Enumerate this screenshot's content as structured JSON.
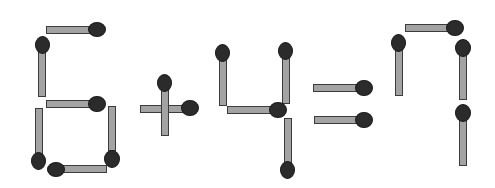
{
  "puzzle": {
    "equation": "6+4=7",
    "colors": {
      "stick": "#a3a3a3",
      "stick_outline": "#3c3c3c",
      "head": "#2b2b2b"
    },
    "matches": [
      {
        "group": "digit-6",
        "name": "six-top",
        "stick": [
          46,
          26,
          45,
          8
        ],
        "head": [
          88,
          22,
          18,
          15
        ]
      },
      {
        "group": "digit-6",
        "name": "six-upper-left",
        "stick": [
          38,
          50,
          8,
          47
        ],
        "head": [
          35,
          36,
          15,
          18
        ]
      },
      {
        "group": "digit-6",
        "name": "six-middle",
        "stick": [
          46,
          100,
          45,
          8
        ],
        "head": [
          88,
          96,
          18,
          16
        ]
      },
      {
        "group": "digit-6",
        "name": "six-lower-left",
        "stick": [
          35,
          108,
          8,
          47
        ],
        "head": [
          31,
          152,
          15,
          18
        ]
      },
      {
        "group": "digit-6",
        "name": "six-lower-right",
        "stick": [
          108,
          106,
          8,
          45
        ],
        "head": [
          104,
          150,
          16,
          18
        ]
      },
      {
        "group": "digit-6",
        "name": "six-bottom",
        "stick": [
          62,
          165,
          45,
          8
        ],
        "head": [
          47,
          162,
          18,
          15
        ]
      },
      {
        "group": "plus",
        "name": "plus-horizontal",
        "stick": [
          140,
          105,
          44,
          8
        ],
        "head": [
          181,
          100,
          18,
          16
        ]
      },
      {
        "group": "plus",
        "name": "plus-vertical",
        "stick": [
          161,
          89,
          8,
          47
        ],
        "head": [
          157,
          74,
          15,
          18
        ]
      },
      {
        "group": "digit-4",
        "name": "four-left",
        "stick": [
          219,
          59,
          8,
          47
        ],
        "head": [
          215,
          44,
          15,
          18
        ]
      },
      {
        "group": "digit-4",
        "name": "four-right",
        "stick": [
          282,
          57,
          8,
          47
        ],
        "head": [
          278,
          42,
          15,
          18
        ]
      },
      {
        "group": "digit-4",
        "name": "four-horizontal",
        "stick": [
          227,
          106,
          44,
          8
        ],
        "head": [
          269,
          102,
          18,
          16
        ]
      },
      {
        "group": "digit-4",
        "name": "four-lower",
        "stick": [
          284,
          118,
          8,
          46
        ],
        "head": [
          280,
          161,
          15,
          18
        ]
      },
      {
        "group": "equals",
        "name": "equals-top",
        "stick": [
          313,
          84,
          44,
          8
        ],
        "head": [
          355,
          80,
          18,
          16
        ]
      },
      {
        "group": "equals",
        "name": "equals-bottom",
        "stick": [
          314,
          116,
          44,
          8
        ],
        "head": [
          355,
          112,
          18,
          16
        ]
      },
      {
        "group": "digit-7",
        "name": "seven-top",
        "stick": [
          405,
          24,
          44,
          8
        ],
        "head": [
          446,
          20,
          18,
          16
        ]
      },
      {
        "group": "digit-7",
        "name": "seven-left",
        "stick": [
          395,
          49,
          8,
          47
        ],
        "head": [
          391,
          34,
          15,
          18
        ]
      },
      {
        "group": "digit-7",
        "name": "seven-upper-right",
        "stick": [
          459,
          54,
          8,
          46
        ],
        "head": [
          455,
          39,
          16,
          18
        ]
      },
      {
        "group": "digit-7",
        "name": "seven-lower-right",
        "stick": [
          459,
          120,
          8,
          46
        ],
        "head": [
          455,
          104,
          16,
          18
        ]
      }
    ]
  }
}
